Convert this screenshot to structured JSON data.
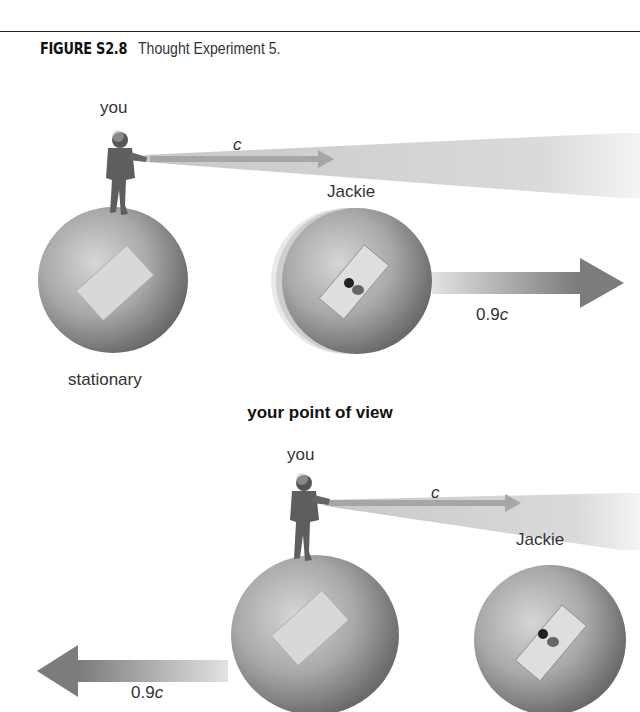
{
  "figure": {
    "number": "FIGURE S2.8",
    "title": "Thought Experiment 5."
  },
  "panel_top": {
    "you_label": "you",
    "light_label": "c",
    "jackie_label": "Jackie",
    "speed_label_prefix": "0.9",
    "speed_label_unit": "c",
    "stationary_label": "stationary",
    "motion_direction": "right"
  },
  "panel_heading": "your point of view",
  "panel_bottom": {
    "you_label": "you",
    "light_label": "c",
    "jackie_label": "Jackie",
    "speed_label_prefix": "0.9",
    "speed_label_unit": "c",
    "motion_direction": "left"
  },
  "colors": {
    "sphere_light": "#cfcfcf",
    "sphere_dark": "#6e6e6e",
    "window": "#d9d9d9",
    "light_beam": "#d8d8d8",
    "arrow": "#8a8a8a",
    "text": "#333333"
  }
}
